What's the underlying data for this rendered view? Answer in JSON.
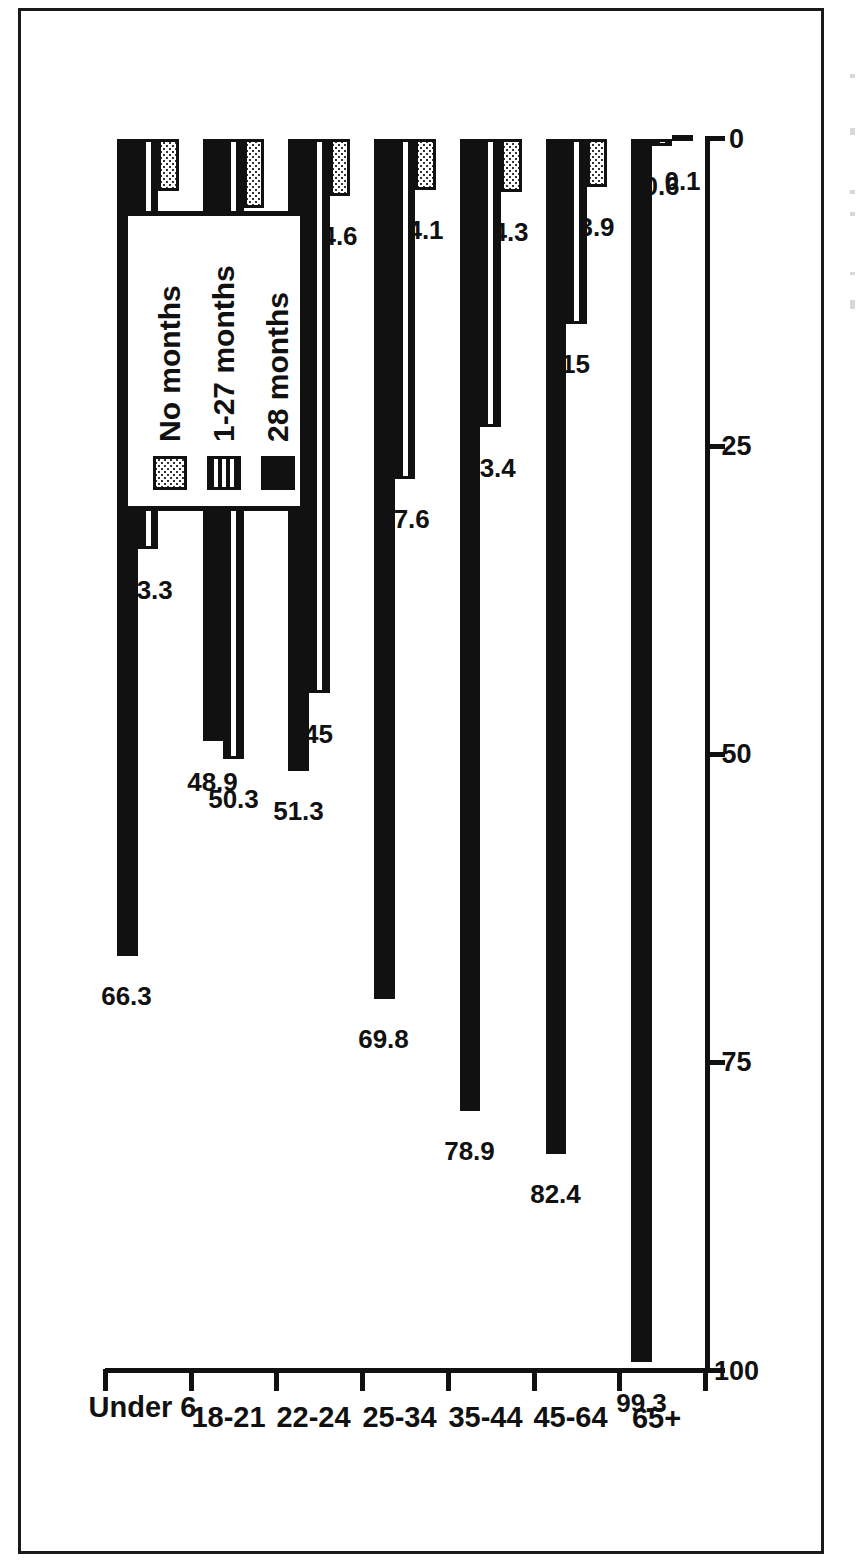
{
  "chart_data": {
    "type": "bar",
    "orientation": "horizontal-rotated",
    "title": "",
    "xlabel": "",
    "ylabel": "",
    "categories": [
      "Under 6",
      "18-21",
      "22-24",
      "25-34",
      "35-44",
      "45-64",
      "65+"
    ],
    "series": [
      {
        "name": "No months",
        "pattern": "dotted",
        "values": [
          4.2,
          5.6,
          4.6,
          4.1,
          4.3,
          3.9,
          0.1
        ],
        "labels": [
          "4.2",
          "5.6",
          "4.6",
          "4.1",
          "4.3",
          "3.9",
          "0.1"
        ]
      },
      {
        "name": "1-27 months",
        "pattern": "horizontal-stripes",
        "values": [
          33.3,
          50.3,
          45,
          27.6,
          23.4,
          15,
          0.6
        ],
        "labels": [
          "33.3",
          "50.3",
          "45",
          "27.6",
          "23.4",
          "15",
          "0.6"
        ]
      },
      {
        "name": "28 months",
        "pattern": "solid",
        "values": [
          66.3,
          48.9,
          51.3,
          69.8,
          78.9,
          82.4,
          99.3
        ],
        "labels": [
          "66.3",
          "48.9",
          "51.3",
          "69.8",
          "78.9",
          "82.4",
          "99.3"
        ]
      }
    ],
    "value_axis": {
      "ticks": [
        0,
        25,
        50,
        75,
        100
      ],
      "tick_labels": [
        "0",
        "25",
        "50",
        "75",
        "100"
      ],
      "min": 0,
      "max": 100,
      "direction": "right-to-left"
    },
    "legend": {
      "position": "top-right",
      "entries": [
        "No months",
        "1-27 months",
        "28 months"
      ]
    },
    "grid": false,
    "colors": {
      "ink": "#111111",
      "background": "#ffffff"
    }
  }
}
